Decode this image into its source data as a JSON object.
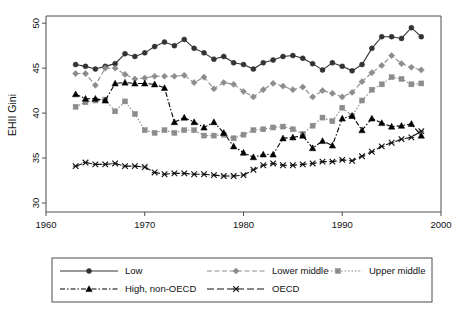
{
  "chart_data": {
    "type": "line",
    "title": "",
    "xlabel": "",
    "ylabel": "EHII Gini",
    "xlim": [
      1960,
      2000
    ],
    "ylim": [
      29,
      50.8
    ],
    "xticks": [
      1960,
      1970,
      1980,
      1990,
      2000
    ],
    "yticks": [
      30,
      35,
      40,
      45,
      50
    ],
    "grid": false,
    "legend_position": "below",
    "x": [
      1963,
      1964,
      1965,
      1966,
      1967,
      1968,
      1969,
      1970,
      1971,
      1972,
      1973,
      1974,
      1975,
      1976,
      1977,
      1978,
      1979,
      1980,
      1981,
      1982,
      1983,
      1984,
      1985,
      1986,
      1987,
      1988,
      1989,
      1990,
      1991,
      1992,
      1993,
      1994,
      1995,
      1996,
      1997,
      1998
    ],
    "series": [
      {
        "name": "Low",
        "color": "#333333",
        "marker": "circle",
        "dash": "solid",
        "values": [
          45.4,
          45.2,
          44.9,
          45.2,
          45.5,
          46.6,
          46.3,
          46.7,
          47.4,
          47.9,
          47.5,
          48.2,
          47.2,
          46.7,
          46.0,
          46.3,
          45.6,
          45.4,
          44.9,
          45.6,
          45.9,
          46.3,
          46.4,
          46.1,
          45.5,
          44.8,
          45.6,
          45.2,
          44.7,
          45.4,
          47.2,
          48.5,
          48.5,
          48.3,
          49.5,
          48.5
        ]
      },
      {
        "name": "Lower middle",
        "color": "#8c8c8c",
        "marker": "diamond",
        "dash": "dashed",
        "values": [
          44.4,
          44.4,
          43.1,
          45.0,
          45.0,
          44.3,
          43.8,
          43.9,
          44.1,
          44.1,
          44.1,
          44.2,
          43.4,
          44.0,
          42.7,
          43.4,
          43.2,
          42.4,
          41.8,
          42.6,
          43.3,
          43.0,
          42.6,
          42.9,
          41.8,
          42.5,
          42.2,
          41.8,
          42.3,
          43.5,
          44.5,
          45.3,
          46.4,
          45.5,
          45.1,
          44.8
        ]
      },
      {
        "name": "Upper middle",
        "color": "#8c8c8c",
        "marker": "square",
        "dash": "dotted",
        "values": [
          40.7,
          41.2,
          41.4,
          41.5,
          40.2,
          41.3,
          39.9,
          38.1,
          37.8,
          38.1,
          37.8,
          38.1,
          38.1,
          37.5,
          37.5,
          37.6,
          37.2,
          37.6,
          38.1,
          38.2,
          38.4,
          38.5,
          38.2,
          37.7,
          38.6,
          39.5,
          39.1,
          40.6,
          39.7,
          41.4,
          42.6,
          43.2,
          44.0,
          43.8,
          43.2,
          43.3
        ]
      },
      {
        "name": "High, non-OECD",
        "color": "#000000",
        "marker": "triangle",
        "dash": "dashdot",
        "values": [
          42.1,
          41.6,
          41.6,
          41.4,
          43.3,
          43.4,
          43.3,
          43.3,
          43.2,
          42.8,
          39.0,
          39.5,
          39.0,
          38.4,
          39.0,
          37.8,
          36.3,
          35.6,
          35.1,
          35.4,
          35.4,
          37.2,
          37.3,
          37.5,
          36.1,
          36.9,
          36.4,
          39.4,
          39.7,
          38.1,
          39.4,
          38.9,
          38.5,
          38.6,
          38.8,
          37.5
        ]
      },
      {
        "name": "OECD",
        "color": "#111111",
        "marker": "x",
        "dash": "longdash",
        "values": [
          34.1,
          34.5,
          34.3,
          34.3,
          34.4,
          34.1,
          34.1,
          34.0,
          33.4,
          33.2,
          33.3,
          33.3,
          33.2,
          33.2,
          33.1,
          33.0,
          33.0,
          33.1,
          33.7,
          34.2,
          34.4,
          34.2,
          34.2,
          34.3,
          34.4,
          34.6,
          34.6,
          34.8,
          34.7,
          35.2,
          35.7,
          36.3,
          36.7,
          37.1,
          37.3,
          38.0
        ]
      }
    ]
  },
  "axes": {
    "ylabel": "EHII Gini",
    "ytick_labels": [
      "30",
      "35",
      "40",
      "45",
      "50"
    ],
    "xtick_labels": [
      "1960",
      "1970",
      "1980",
      "1990",
      "2000"
    ]
  },
  "legend": {
    "entries": [
      {
        "label": "Low",
        "key": "low"
      },
      {
        "label": "Lower middle",
        "key": "lower-middle"
      },
      {
        "label": "Upper middle",
        "key": "upper-middle"
      },
      {
        "label": "High, non-OECD",
        "key": "high-non-oecd"
      },
      {
        "label": "OECD",
        "key": "oecd"
      }
    ]
  }
}
